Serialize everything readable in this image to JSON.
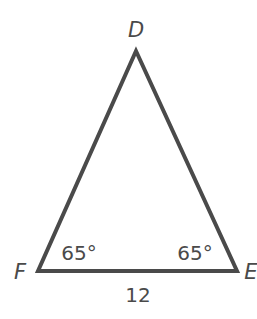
{
  "diagram": {
    "type": "triangle",
    "line_color": "#4a4a4a",
    "vertices": {
      "D": {
        "label": "D",
        "x": 136,
        "y": 51
      },
      "F": {
        "label": "F",
        "x": 38,
        "y": 271
      },
      "E": {
        "label": "E",
        "x": 237,
        "y": 271
      }
    },
    "angles": {
      "F": "65°",
      "E": "65°"
    },
    "sides": {
      "FE": "12"
    }
  }
}
